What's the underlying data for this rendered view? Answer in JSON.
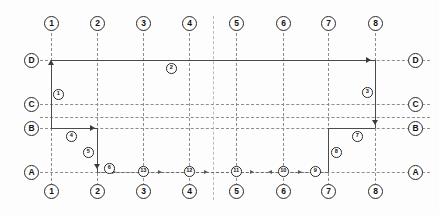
{
  "diagram": {
    "type": "architectural-grid",
    "column_axes": [
      "1",
      "2",
      "3",
      "4",
      "5",
      "6",
      "7",
      "8"
    ],
    "row_axes_top_to_bottom": [
      "D",
      "C",
      "B",
      "A"
    ],
    "column_axes_bottom": [
      "1",
      "2",
      "3",
      "4",
      "5",
      "6",
      "7",
      "8"
    ],
    "row_axes_left": [
      "D",
      "C",
      "B",
      "A"
    ],
    "row_axes_right": [
      "D",
      "C",
      "B",
      "A"
    ],
    "step_markers": [
      {
        "id": "1",
        "label": "1"
      },
      {
        "id": "2",
        "label": "2"
      },
      {
        "id": "3",
        "label": "3"
      },
      {
        "id": "4",
        "label": "4"
      },
      {
        "id": "5",
        "label": "5"
      },
      {
        "id": "6",
        "label": "6"
      },
      {
        "id": "7",
        "label": "7"
      },
      {
        "id": "8",
        "label": "8"
      },
      {
        "id": "9",
        "label": "9"
      },
      {
        "id": "10",
        "label": "10"
      },
      {
        "id": "11",
        "label": "11"
      },
      {
        "id": "12",
        "label": "12"
      },
      {
        "id": "13",
        "label": "13"
      }
    ],
    "colors": {
      "grid_line": "#8d8d8d",
      "route_line": "#4a4a4a",
      "bubble_border": "#2b2b2b",
      "background": "#fdfdfd",
      "text": "#111111"
    }
  }
}
